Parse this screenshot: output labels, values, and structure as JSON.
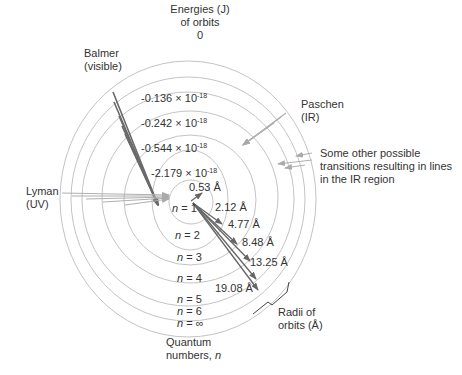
{
  "title": "Energies (J) of orbits",
  "energy_header": {
    "line1": "Energies (J)",
    "line2": "of orbits"
  },
  "energies": [
    {
      "orbit": "n=∞",
      "value": "0"
    },
    {
      "orbit": "n=4",
      "mantissa": "-0.136",
      "times": "×",
      "base": "10",
      "exp": "-18"
    },
    {
      "orbit": "n=3",
      "mantissa": "-0.242",
      "times": "×",
      "base": "10",
      "exp": "-18"
    },
    {
      "orbit": "n=2",
      "mantissa": "-0.544",
      "times": "×",
      "base": "10",
      "exp": "-18"
    },
    {
      "orbit": "n=1",
      "mantissa": "-2.179",
      "times": "×",
      "base": "10",
      "exp": "-18"
    }
  ],
  "radii": [
    "0.53 Å",
    "2.12 Å",
    "4.77 Å",
    "8.48 Å",
    "13.25 Å",
    "19.08 Å"
  ],
  "radii_label": {
    "line1": "Radii of",
    "line2": "orbits (Å)"
  },
  "quantum_numbers": [
    {
      "n": "n",
      "eq": " = 1"
    },
    {
      "n": "n",
      "eq": " = 2"
    },
    {
      "n": "n",
      "eq": " = 3"
    },
    {
      "n": "n",
      "eq": " = 4"
    },
    {
      "n": "n",
      "eq": " = 5"
    },
    {
      "n": "n",
      "eq": " = 6"
    },
    {
      "n": "n",
      "eq": " = ∞"
    }
  ],
  "quantum_label": {
    "line1": "Quantum",
    "line2": "numbers, ",
    "n": "n"
  },
  "series": {
    "balmer": {
      "line1": "Balmer",
      "line2": "(visible)"
    },
    "paschen": {
      "line1": "Paschen",
      "line2": "(IR)"
    },
    "lyman": {
      "line1": "Lyman",
      "line2": "(UV)"
    },
    "other": {
      "line1": "Some other possible",
      "line2": "transitions resulting in lines",
      "line3": "in the IR region"
    }
  },
  "colors": {
    "orbit": "#bdbdbd",
    "arrow_dark": "#666666",
    "arrow_light": "#aaaaaa",
    "text": "#333333"
  }
}
